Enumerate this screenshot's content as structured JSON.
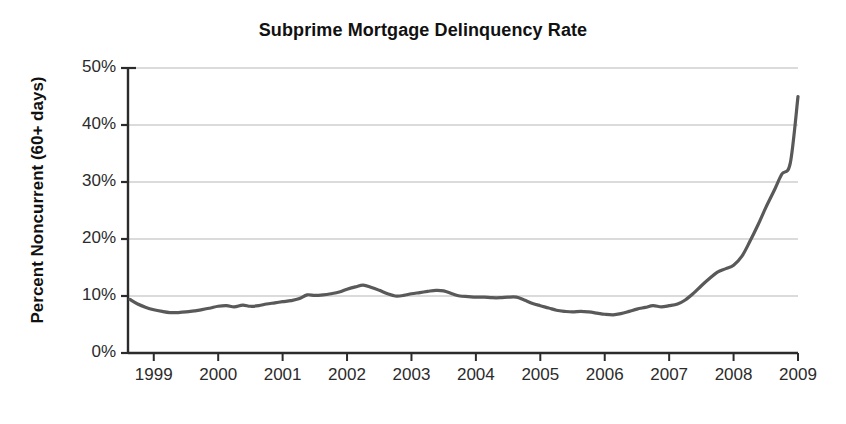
{
  "chart_data": {
    "type": "line",
    "title": "Subprime Mortgage Delinquency Rate",
    "xlabel": "",
    "ylabel": "Percent Noncurrent (60+ days)",
    "xlim": [
      1998.6,
      2009.0
    ],
    "ylim": [
      0,
      50
    ],
    "grid": true,
    "grid_axis": "y",
    "legend": null,
    "line_color": "#595959",
    "gridline_color": "#b8b8b8",
    "axis_color": "#2b2b2b",
    "y_ticks": [
      0,
      10,
      20,
      30,
      40,
      50
    ],
    "y_tick_labels": [
      "0%",
      "10%",
      "20%",
      "30%",
      "40%",
      "50%"
    ],
    "x_ticks": [
      1999,
      2000,
      2001,
      2002,
      2003,
      2004,
      2005,
      2006,
      2007,
      2008,
      2009
    ],
    "x_tick_labels": [
      "1999",
      "2000",
      "2001",
      "2002",
      "2003",
      "2004",
      "2005",
      "2006",
      "2007",
      "2008",
      "2009"
    ],
    "series": [
      {
        "name": "Percent Noncurrent (60+ days)",
        "x": [
          1998.63,
          1998.75,
          1998.88,
          1999.0,
          1999.13,
          1999.25,
          1999.38,
          1999.5,
          1999.63,
          1999.75,
          1999.88,
          2000.0,
          2000.13,
          2000.25,
          2000.38,
          2000.5,
          2000.63,
          2000.75,
          2000.88,
          2001.0,
          2001.13,
          2001.25,
          2001.38,
          2001.5,
          2001.63,
          2001.75,
          2001.88,
          2002.0,
          2002.13,
          2002.25,
          2002.38,
          2002.5,
          2002.63,
          2002.75,
          2002.88,
          2003.0,
          2003.13,
          2003.25,
          2003.38,
          2003.5,
          2003.63,
          2003.75,
          2003.88,
          2004.0,
          2004.13,
          2004.25,
          2004.38,
          2004.5,
          2004.63,
          2004.75,
          2004.88,
          2005.0,
          2005.13,
          2005.25,
          2005.38,
          2005.5,
          2005.63,
          2005.75,
          2005.88,
          2006.0,
          2006.13,
          2006.25,
          2006.38,
          2006.5,
          2006.63,
          2006.75,
          2006.88,
          2007.0,
          2007.13,
          2007.25,
          2007.38,
          2007.5,
          2007.63,
          2007.75,
          2007.88,
          2008.0,
          2008.13,
          2008.25,
          2008.38,
          2008.5,
          2008.63,
          2008.75,
          2008.88,
          2009.0
        ],
        "y": [
          9.4,
          8.6,
          8.0,
          7.6,
          7.3,
          7.1,
          7.1,
          7.2,
          7.4,
          7.6,
          7.9,
          8.2,
          8.3,
          8.1,
          8.4,
          8.2,
          8.3,
          8.6,
          8.8,
          9.0,
          9.2,
          9.5,
          10.2,
          10.1,
          10.2,
          10.4,
          10.7,
          11.2,
          11.6,
          11.9,
          11.5,
          11.0,
          10.4,
          10.0,
          10.1,
          10.4,
          10.6,
          10.8,
          11.0,
          10.9,
          10.4,
          10.0,
          9.9,
          9.8,
          9.8,
          9.7,
          9.7,
          9.8,
          9.8,
          9.3,
          8.7,
          8.3,
          7.9,
          7.5,
          7.3,
          7.2,
          7.3,
          7.2,
          7.0,
          6.8,
          6.7,
          6.9,
          7.3,
          7.7,
          8.0,
          8.3,
          8.1,
          8.3,
          8.6,
          9.3,
          10.5,
          11.8,
          13.1,
          14.2,
          14.8,
          15.4,
          17.0,
          19.5,
          22.5,
          25.5,
          28.5,
          31.4,
          33.3,
          45.0
        ]
      }
    ],
    "annotations": {
      "peak_2002": 11.9,
      "trough_2005": 6.7,
      "final_2009": 45.0
    }
  },
  "title": "Subprime Mortgage Delinquency Rate",
  "ylabel": "Percent Noncurrent (60+ days)"
}
